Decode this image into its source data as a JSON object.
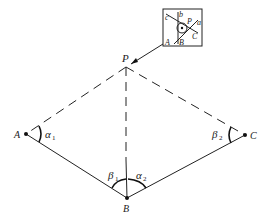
{
  "diagram": {
    "type": "surveying-traverse",
    "points": {
      "P": {
        "label": "P"
      },
      "A": {
        "label": "A"
      },
      "B": {
        "label": "B"
      },
      "C": {
        "label": "C"
      }
    },
    "angles": [
      {
        "id": "alpha1",
        "symbol": "α",
        "subscript": "1",
        "vertex": "A"
      },
      {
        "id": "beta1",
        "symbol": "β",
        "subscript": "1",
        "vertex": "B"
      },
      {
        "id": "alpha2",
        "symbol": "α",
        "subscript": "2",
        "vertex": "B"
      },
      {
        "id": "beta2",
        "symbol": "β",
        "subscript": "2",
        "vertex": "C"
      }
    ],
    "edges": [
      {
        "from": "A",
        "to": "B",
        "style": "solid"
      },
      {
        "from": "B",
        "to": "C",
        "style": "solid"
      },
      {
        "from": "P",
        "to": "A",
        "style": "dashed"
      },
      {
        "from": "P",
        "to": "C",
        "style": "dashed"
      },
      {
        "from": "P",
        "to": "B",
        "style": "dashed-solid"
      }
    ],
    "inset": {
      "description": "error triangle detail at P",
      "labels": {
        "c": "c",
        "b": "b",
        "a": "a",
        "P": "P",
        "A": "A",
        "B": "B",
        "C": "C"
      }
    }
  }
}
